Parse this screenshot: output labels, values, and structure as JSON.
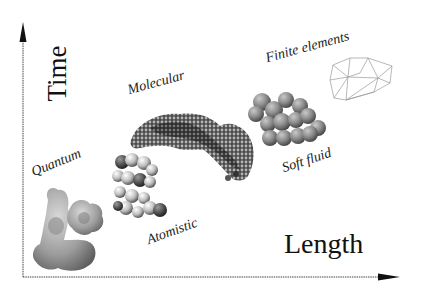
{
  "diagram": {
    "axes": {
      "x_label": "Length",
      "y_label": "Time"
    },
    "regimes": [
      {
        "id": "quantum",
        "label": "Quantum",
        "depiction": "electron-density-surface"
      },
      {
        "id": "atomistic",
        "label": "Atomistic",
        "depiction": "space-filling-atoms"
      },
      {
        "id": "molecular",
        "label": "Molecular",
        "depiction": "coarse-grained-molecule"
      },
      {
        "id": "soft-fluid",
        "label": "Soft fluid",
        "depiction": "bead-cluster"
      },
      {
        "id": "finite-elements",
        "label": "Finite elements",
        "depiction": "triangular-mesh"
      }
    ],
    "colors": {
      "axis": "#333333",
      "text": "#222222",
      "bead": "#8a8a8a",
      "mesh": "#9a9a9a"
    }
  }
}
